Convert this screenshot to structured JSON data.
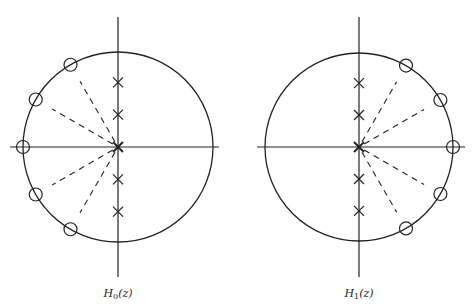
{
  "figure": {
    "type": "pole-zero plots",
    "stroke_color": "#222222",
    "plots": [
      {
        "id": "h0",
        "label_main": "H",
        "label_sub": "0",
        "label_arg": "(z)",
        "center": [
          118,
          147
        ],
        "radius": 95,
        "axes": {
          "h": [
            10,
            219
          ],
          "v": [
            17,
            277
          ]
        },
        "zero_angles_deg": [
          120,
          150,
          180,
          210,
          240
        ],
        "dashed_angles_deg": [
          120,
          150,
          210,
          240
        ],
        "pole_imag": [
          0.68,
          0.34,
          0,
          -0.34,
          -0.68
        ]
      },
      {
        "id": "h1",
        "label_main": "H",
        "label_sub": "1",
        "label_arg": "(z)",
        "center": [
          359,
          147
        ],
        "radius": 94,
        "axes": {
          "h": [
            257,
            465
          ],
          "v": [
            17,
            277
          ]
        },
        "zero_angles_deg": [
          60,
          30,
          0,
          -30,
          -60
        ],
        "dashed_angles_deg": [
          60,
          30,
          -30,
          -60
        ],
        "pole_imag": [
          0.68,
          0.34,
          0,
          -0.34,
          -0.68
        ]
      }
    ]
  }
}
